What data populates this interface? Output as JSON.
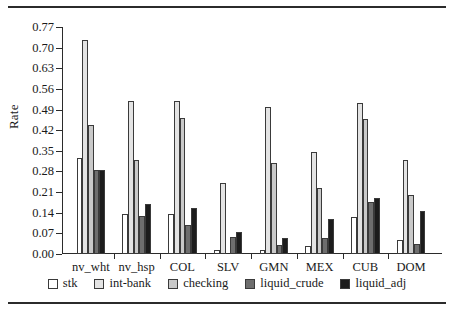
{
  "chart_data": {
    "type": "bar",
    "title": "",
    "xlabel": "",
    "ylabel": "Rate",
    "ylim": [
      0.0,
      0.77
    ],
    "yticks": [
      "0.00",
      "0.07",
      "0.14",
      "0.21",
      "0.28",
      "0.35",
      "0.42",
      "0.49",
      "0.56",
      "0.63",
      "0.70",
      "0.77"
    ],
    "ytick_values": [
      0.0,
      0.07,
      0.14,
      0.21,
      0.28,
      0.35,
      0.42,
      0.49,
      0.56,
      0.63,
      0.7,
      0.77
    ],
    "grid": false,
    "legend_position": "bottom",
    "categories": [
      "nv_wht",
      "nv_hsp",
      "COL",
      "SLV",
      "GMN",
      "MEX",
      "CUB",
      "DOM"
    ],
    "series": [
      {
        "name": "stk",
        "color": "#ffffff",
        "values": [
          0.325,
          0.137,
          0.135,
          0.015,
          0.012,
          0.026,
          0.125,
          0.046
        ]
      },
      {
        "name": "int-bank",
        "color": "#e3e3e3",
        "values": [
          0.725,
          0.52,
          0.52,
          0.24,
          0.5,
          0.345,
          0.512,
          0.32
        ]
      },
      {
        "name": "checking",
        "color": "#c9c9c9",
        "values": [
          0.437,
          0.32,
          0.46,
          0.0,
          0.31,
          0.225,
          0.457,
          0.2
        ]
      },
      {
        "name": "liquid_crude",
        "color": "#6e6e6e",
        "values": [
          0.284,
          0.128,
          0.1,
          0.058,
          0.03,
          0.055,
          0.175,
          0.035
        ]
      },
      {
        "name": "liquid_adj",
        "color": "#1c1c1c",
        "values": [
          0.284,
          0.168,
          0.155,
          0.075,
          0.055,
          0.12,
          0.19,
          0.145
        ]
      }
    ]
  },
  "legend": {
    "items": [
      {
        "label": "stk"
      },
      {
        "label": "int-bank"
      },
      {
        "label": "checking"
      },
      {
        "label": "liquid_crude"
      },
      {
        "label": "liquid_adj"
      }
    ]
  },
  "rules": {
    "top": "horizontal-rule",
    "bottom": "horizontal-rule"
  }
}
